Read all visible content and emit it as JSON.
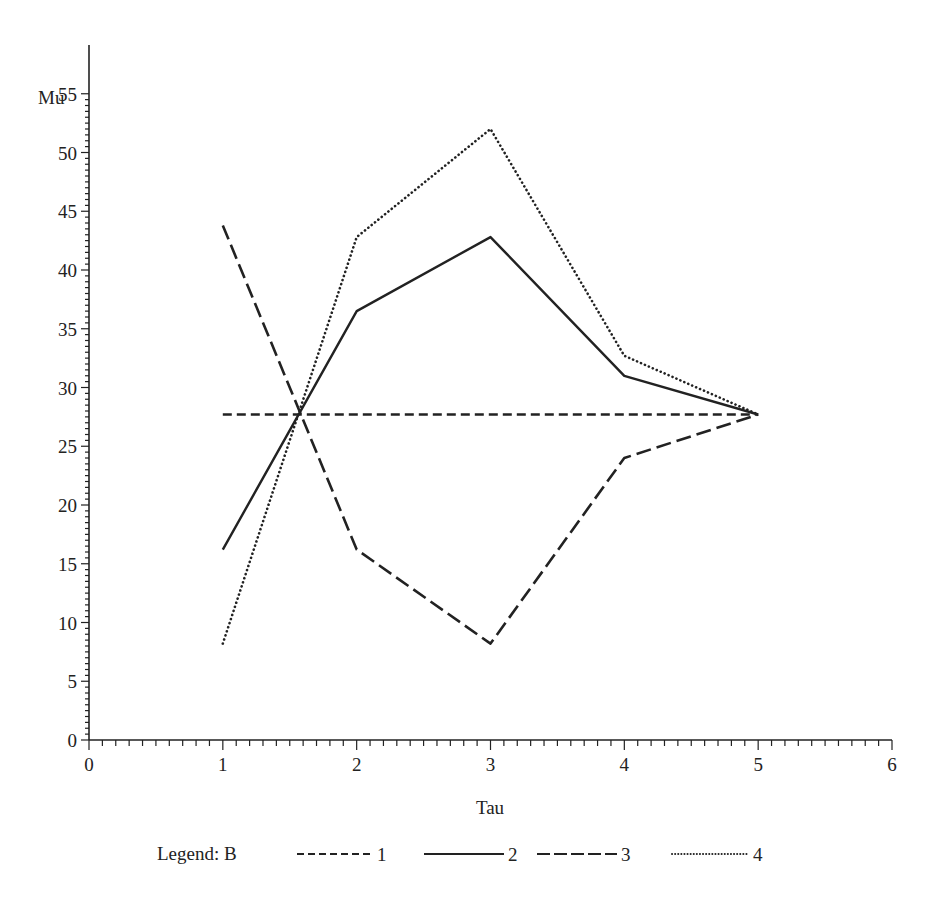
{
  "chart_data": {
    "type": "line",
    "title": "",
    "xlabel": "Tau",
    "ylabel": "Mu",
    "xlim": [
      0,
      6
    ],
    "ylim": [
      0,
      57
    ],
    "x_ticks": [
      "0",
      "1",
      "2",
      "3",
      "4",
      "5",
      "6"
    ],
    "y_ticks": [
      "0",
      "5",
      "10",
      "15",
      "20",
      "25",
      "30",
      "35",
      "40",
      "45",
      "50",
      "55"
    ],
    "x_minor_per_major": 10,
    "y_minor_per_major": 10,
    "grid": false,
    "legend_title": "Legend: B",
    "legend_position": "bottom",
    "x": [
      1,
      2,
      3,
      4,
      5
    ],
    "series": [
      {
        "name": "1",
        "style": "short-dash",
        "values": [
          27.7,
          27.7,
          27.7,
          27.7,
          27.7
        ]
      },
      {
        "name": "2",
        "style": "solid",
        "values": [
          16.2,
          36.5,
          42.8,
          31.0,
          27.7
        ]
      },
      {
        "name": "3",
        "style": "long-dash",
        "values": [
          43.8,
          16.2,
          8.2,
          24.0,
          27.7
        ]
      },
      {
        "name": "4",
        "style": "dotted",
        "values": [
          8.2,
          42.8,
          52.0,
          32.7,
          27.7
        ]
      }
    ],
    "line_color": "#222222"
  }
}
